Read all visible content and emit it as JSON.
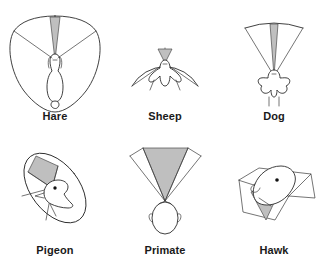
{
  "figure": {
    "background_color": "#ffffff",
    "line_color": "#2b2b2b",
    "binocular_fill_color": "#bfbfbf",
    "label_color": "#1a1a1a",
    "panels": [
      {
        "id": "hare",
        "label": "Hare",
        "icon": "hare-head-top-view-icon",
        "view": "dorsal",
        "field_shape": "near-panoramic-shield",
        "binocular_wedge": "narrow-forward-cone",
        "row": 0,
        "column": 0
      },
      {
        "id": "sheep",
        "label": "Sheep",
        "icon": "sheep-head-top-view-icon",
        "view": "dorsal",
        "field_shape": "wide-semicircle",
        "binocular_wedge": "narrow-forward-cone",
        "row": 0,
        "column": 1
      },
      {
        "id": "dog",
        "label": "Dog",
        "icon": "dog-head-top-view-icon",
        "view": "dorsal",
        "field_shape": "forward-fan",
        "binocular_wedge": "long-narrow-forward-cone",
        "row": 0,
        "column": 2
      },
      {
        "id": "pigeon",
        "label": "Pigeon",
        "icon": "pigeon-head-side-view-icon",
        "view": "oblique",
        "field_shape": "tilted-ellipse",
        "binocular_wedge": "upper-left-wedge",
        "row": 1,
        "column": 0
      },
      {
        "id": "primate",
        "label": "Primate",
        "icon": "primate-head-top-view-icon",
        "view": "dorsal",
        "field_shape": "forward-fan",
        "binocular_wedge": "broad-forward-cone",
        "row": 1,
        "column": 1
      },
      {
        "id": "hawk",
        "label": "Hawk",
        "icon": "hawk-head-side-view-icon",
        "view": "oblique",
        "field_shape": "tilted-wedge-pair",
        "binocular_wedge": "lower-forward-wedge",
        "row": 1,
        "column": 2
      }
    ]
  }
}
